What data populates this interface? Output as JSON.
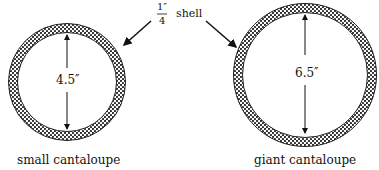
{
  "shell_label": {
    "numerator": "1″",
    "denominator": "4",
    "word": "shell"
  },
  "small": {
    "diameter": "4.5″",
    "caption": "small cantaloupe"
  },
  "giant": {
    "diameter": "6.5″",
    "caption": "giant cantaloupe"
  },
  "colors": {
    "ink": "#111111",
    "rind": "#2a2a2a"
  }
}
